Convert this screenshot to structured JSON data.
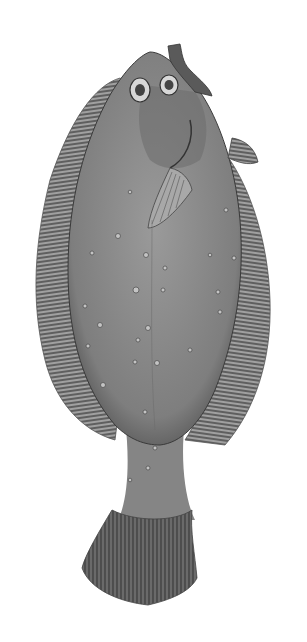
{
  "image": {
    "subject": "flounder fish illustration",
    "style": "monochrome engraving",
    "background": "#ffffff",
    "colors": {
      "body": "#8a8a8a",
      "body_dark": "#5a5a5a",
      "fin": "#9a9a9a",
      "fin_ray": "#3c3c3c",
      "spot": "#c8c8c8",
      "outline": "#3a3a3a"
    }
  }
}
